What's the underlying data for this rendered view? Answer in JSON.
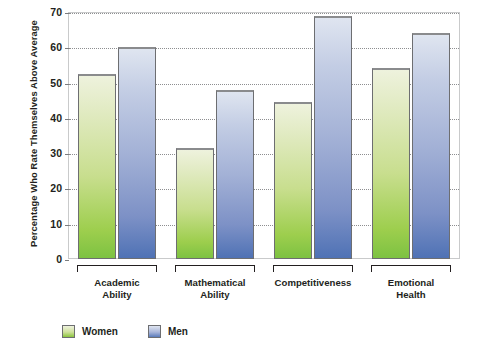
{
  "chart_data": {
    "type": "bar",
    "title": "",
    "xlabel": "",
    "ylabel": "Percentage Who Rate Themselves Above Average",
    "ylim": [
      0,
      70
    ],
    "yticks": [
      0,
      10,
      20,
      30,
      40,
      50,
      60,
      70
    ],
    "ytick_labels": [
      "0",
      "10",
      "20",
      "30",
      "40",
      "50",
      "60",
      "70"
    ],
    "grid": true,
    "legend_position": "bottom-left",
    "categories": [
      "Academic\nAbility",
      "Mathematical\nAbility",
      "Competitiveness",
      "Emotional\nHealth"
    ],
    "category_lines": [
      [
        "Academic",
        "Ability"
      ],
      [
        "Mathematical",
        "Ability"
      ],
      [
        "Competitiveness",
        ""
      ],
      [
        "Emotional",
        "Health"
      ]
    ],
    "series": [
      {
        "name": "Women",
        "color": "#8cc63f",
        "values": [
          52.5,
          31.5,
          44.5,
          54
        ]
      },
      {
        "name": "Men",
        "color": "#5a7bbb",
        "values": [
          60,
          48,
          69,
          64
        ]
      }
    ]
  },
  "legend": {
    "items": [
      {
        "label": "Women",
        "swatch": "women"
      },
      {
        "label": "Men",
        "swatch": "men"
      }
    ]
  },
  "colors": {
    "women_top": "#eef2dd",
    "women_bottom": "#7dc242",
    "men_top": "#dfe5f0",
    "men_bottom": "#4f72b5",
    "grid": "#8d8e90",
    "frame": "#c9cacb",
    "text": "#231f20"
  }
}
